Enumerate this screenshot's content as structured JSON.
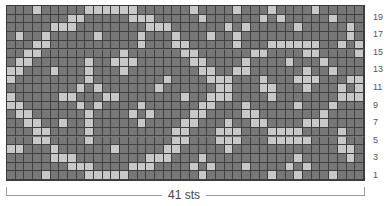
{
  "chart": {
    "columns": 41,
    "rows": 20,
    "colors": {
      "background": "#777777",
      "contrast": "#c8c8c8",
      "grid": "#3f3f3f"
    },
    "row_labels": [
      "19",
      "17",
      "15",
      "13",
      "11",
      "9",
      "7",
      "5",
      "3",
      "1"
    ],
    "width_label": "41 sts",
    "light_cells_by_row_top_to_bottom": [
      [
        3,
        9,
        10,
        11,
        12,
        13,
        14,
        21,
        26,
        30,
        35
      ],
      [
        7,
        8,
        14,
        15,
        16,
        22,
        29,
        31,
        37
      ],
      [
        5,
        6,
        7,
        16,
        17,
        18,
        25,
        27,
        33,
        39
      ],
      [
        1,
        4,
        10,
        15,
        19,
        23,
        26,
        39
      ],
      [
        3,
        4,
        15,
        19,
        20,
        26,
        30,
        31,
        32,
        33,
        34,
        35,
        38,
        40
      ],
      [
        2,
        3,
        13,
        20,
        21,
        28,
        29,
        34,
        35,
        40
      ],
      [
        1,
        2,
        9,
        12,
        13,
        14,
        21,
        22,
        27,
        32,
        36
      ],
      [
        0,
        1,
        5,
        9,
        13,
        22,
        23,
        26,
        27,
        34,
        37
      ],
      [
        0,
        9,
        18,
        23,
        24,
        25,
        29,
        33,
        34,
        35,
        39,
        40
      ],
      [
        8,
        10,
        17,
        24,
        25,
        29,
        30,
        34,
        38,
        40
      ],
      [
        0,
        6,
        7,
        11,
        12,
        20,
        23,
        24,
        25,
        30,
        38,
        39,
        40
      ],
      [
        0,
        1,
        8,
        10,
        15,
        22,
        23,
        27,
        33,
        37
      ],
      [
        1,
        2,
        9,
        14,
        16,
        21,
        22,
        27,
        28,
        36
      ],
      [
        2,
        3,
        6,
        9,
        15,
        20,
        21,
        25,
        28,
        29,
        34,
        35,
        36
      ],
      [
        3,
        4,
        9,
        19,
        20,
        24,
        25,
        26,
        30,
        31,
        32,
        33,
        38
      ],
      [
        3,
        4,
        9,
        19,
        20,
        24,
        25,
        26,
        30,
        31,
        32,
        33,
        34,
        38
      ],
      [
        0,
        1,
        5,
        12,
        18,
        19,
        25,
        38,
        39
      ],
      [
        5,
        6,
        7,
        16,
        17,
        18,
        22,
        33,
        39
      ],
      [
        7,
        8,
        9,
        14,
        15,
        16,
        21,
        23,
        27,
        32,
        34
      ],
      [
        4,
        9,
        10,
        11,
        12,
        13,
        22,
        30,
        33,
        37
      ]
    ]
  }
}
